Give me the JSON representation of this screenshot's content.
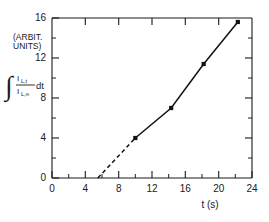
{
  "chart_data": {
    "type": "scatter",
    "title": "",
    "subtitle": "",
    "xlabel": "t (s)",
    "ylabel": "∫ (I_L,t / I_L,∞) dt",
    "ylabel_units": "(ARBIT. UNITS)",
    "xlim": [
      0,
      24
    ],
    "ylim": [
      0,
      16
    ],
    "x_major_ticks": [
      0,
      4,
      8,
      12,
      16,
      20,
      24
    ],
    "x_major_tick_labels": [
      "0",
      "4",
      "8",
      "12",
      "16",
      "20",
      "24"
    ],
    "x_minor_ticks": [
      2,
      6,
      10,
      14,
      18,
      22
    ],
    "y_major_ticks": [
      0,
      4,
      8,
      12,
      16
    ],
    "y_major_tick_labels": [
      "0",
      "4",
      "8",
      "12",
      "16"
    ],
    "y_minor_ticks": [
      2,
      6,
      10,
      14
    ],
    "grid": false,
    "legend": null,
    "series": [
      {
        "name": "integrated luminescence",
        "marker": "filled-square",
        "line_style": "solid",
        "x": [
          10.0,
          14.3,
          18.2,
          22.3
        ],
        "y": [
          4.0,
          7.0,
          11.4,
          15.6
        ]
      },
      {
        "name": "extrapolation",
        "marker": "none",
        "line_style": "dashed",
        "x": [
          5.5,
          10.0
        ],
        "y": [
          0.0,
          4.0
        ]
      }
    ],
    "x_intercept": 5.5,
    "frame": "box",
    "ticks_inward": true
  },
  "axis_label_parts": {
    "integral_symbol": "∫",
    "numerator": "I",
    "numerator_sub": "L,t",
    "denominator": "I",
    "denominator_sub": "L,∞",
    "differential": "dt",
    "units_line1": "(ARBIT.",
    "units_line2": "UNITS)"
  },
  "colors": {
    "axis": "#1a1a1a",
    "data": "#111111",
    "background": "#ffffff"
  }
}
